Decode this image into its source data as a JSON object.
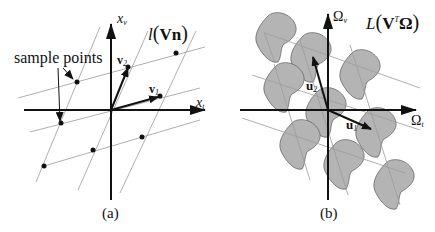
{
  "panel_a": {
    "caption": "(a)",
    "annotation": "sample points",
    "axis_vertical": {
      "symbol": "x",
      "subscript": "v"
    },
    "axis_horizontal": {
      "symbol": "x",
      "subscript": "t"
    },
    "lattice_label": {
      "func": "l",
      "open": "(",
      "arg": "Vn",
      "close": ")"
    },
    "vectors": [
      {
        "symbol": "v",
        "subscript": "1"
      },
      {
        "symbol": "v",
        "subscript": "2"
      }
    ]
  },
  "panel_b": {
    "caption": "(b)",
    "axis_vertical": {
      "symbol": "Ω",
      "subscript": "v"
    },
    "axis_horizontal": {
      "symbol": "Ω",
      "subscript": "t"
    },
    "lattice_label": {
      "func": "L",
      "open": "(",
      "arg_main": "V",
      "arg_sup": "T",
      "arg_tail": "Ω",
      "close": ")"
    },
    "vectors": [
      {
        "symbol": "u",
        "subscript": "1"
      },
      {
        "symbol": "u",
        "subscript": "2"
      }
    ]
  },
  "colors": {
    "ink": "#111111",
    "lattice_line": "#9a9a9a",
    "blob_fill": "#b4b4b4",
    "blob_stroke": "#666666"
  }
}
